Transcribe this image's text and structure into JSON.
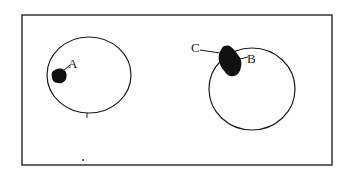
{
  "diagram": {
    "type": "schematic",
    "frame": {
      "x": 22,
      "y": 15,
      "width": 310,
      "height": 150,
      "stroke": "#333333"
    },
    "circles": [
      {
        "id": "left-circle",
        "cx": 89,
        "cy": 75,
        "rx": 42,
        "ry": 38
      },
      {
        "id": "right-circle",
        "cx": 252,
        "cy": 89,
        "rx": 43,
        "ry": 41
      }
    ],
    "labels": [
      {
        "id": "A",
        "text": "A",
        "x": 68,
        "y": 68
      },
      {
        "id": "B",
        "text": "B",
        "x": 247,
        "y": 63
      },
      {
        "id": "C",
        "text": "C",
        "x": 191,
        "y": 52
      }
    ],
    "colors": {
      "ink": "#1a1a1a",
      "background": "#ffffff"
    }
  }
}
